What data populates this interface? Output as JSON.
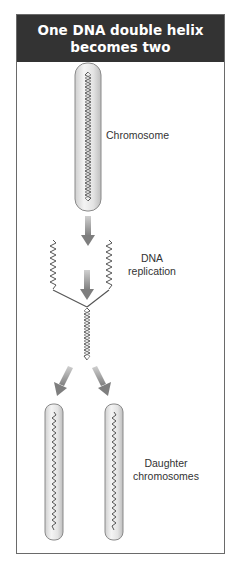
{
  "header": {
    "title_line1": "One DNA double helix",
    "title_line2": "becomes two"
  },
  "labels": {
    "chromosome": "Chromosome",
    "replication_line1": "DNA",
    "replication_line2": "replication",
    "daughter_line1": "Daughter",
    "daughter_line2": "chromosomes"
  },
  "colors": {
    "header_bg": "#333333",
    "header_text": "#ffffff",
    "chromosome_fill": "#e6e6e6",
    "chromosome_stroke": "#8a8a8a",
    "helix_stroke": "#555555",
    "arrow_fill": "#8c8c8c",
    "frame_border": "#6a6a6a"
  }
}
